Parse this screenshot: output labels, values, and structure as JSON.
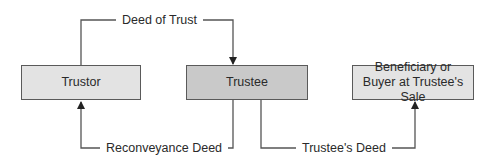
{
  "diagram": {
    "nodes": [
      {
        "id": "trustor",
        "lines": [
          "Trustor"
        ],
        "fill": "#e3e3e3"
      },
      {
        "id": "trustee",
        "lines": [
          "Trustee"
        ],
        "fill": "#c9c9c9"
      },
      {
        "id": "beneficiary",
        "lines": [
          "Beneficiary or",
          "Buyer at Trustee's Sale"
        ],
        "fill": "#e3e3e3"
      }
    ],
    "edges": [
      {
        "from": "trustor",
        "to": "trustee",
        "label": "Deed of Trust"
      },
      {
        "from": "trustee",
        "to": "trustor",
        "label": "Reconveyance Deed"
      },
      {
        "from": "trustee",
        "to": "beneficiary",
        "label": "Trustee's Deed"
      }
    ],
    "colors": {
      "line": "#555555",
      "border": "#5a5a5a",
      "text": "#2a2a2a"
    }
  }
}
